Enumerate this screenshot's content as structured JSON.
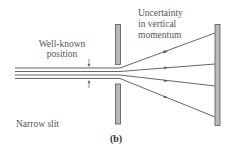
{
  "labels": {
    "position_line1": "Well-known",
    "position_line2": "position",
    "uncertainty_line1": "Uncertainty",
    "uncertainty_line2": "in vertical",
    "uncertainty_line3": "momentum",
    "slit": "Narrow slit",
    "caption": "(b)"
  },
  "colors": {
    "bar_fill": "#b9b9b9",
    "line": "#555555",
    "text": "#555555"
  },
  "incoming_beams": 4,
  "diffracted_rays": 4
}
